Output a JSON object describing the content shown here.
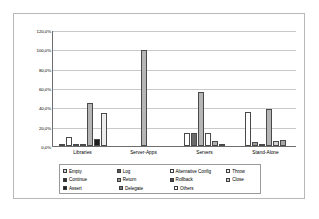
{
  "chart_data": {
    "type": "bar",
    "title": "",
    "subtitle": "",
    "xlabel": "",
    "ylabel": "",
    "ylim": [
      0,
      120
    ],
    "grid": true,
    "legend_position": "bottom",
    "ytick_labels": [
      "120,0%",
      "100,0%",
      "80,0%",
      "60,0%",
      "40,0%",
      "20,0%",
      "0,0%"
    ],
    "ytick_values": [
      120,
      100,
      80,
      60,
      40,
      20,
      0
    ],
    "categories": [
      "Libraries",
      "Server-Apps",
      "Servers",
      "Stand-Alone"
    ],
    "series": [
      {
        "name": "Empty",
        "color": "#d9d9d9",
        "values": [
          1.5,
          0,
          0,
          0
        ]
      },
      {
        "name": "Log",
        "color": "#5a5a5a",
        "values": [
          0,
          0,
          0,
          0
        ]
      },
      {
        "name": "Alternative Config",
        "color": "#ffffff",
        "values": [
          9.0,
          0,
          13.0,
          35.0
        ]
      },
      {
        "name": "Throw",
        "color": "#f2f2f2",
        "values": [
          0,
          0,
          0,
          0
        ]
      },
      {
        "name": "Continue",
        "color": "#4a4a4a",
        "values": [
          1.0,
          0,
          0,
          4.5
        ]
      },
      {
        "name": "Return",
        "color": "#9a9a9a",
        "values": [
          2.5,
          0,
          13.0,
          1.0
        ]
      },
      {
        "name": "Rollback",
        "color": "#b5b5b5",
        "values": [
          44.0,
          99.5,
          56.0,
          38.0
        ]
      },
      {
        "name": "Close",
        "color": "#1e1e1e",
        "values": [
          7.0,
          0,
          0,
          0
        ]
      },
      {
        "name": "Assert",
        "color": "#2e2e2e",
        "values": [
          0,
          0,
          0,
          0
        ]
      },
      {
        "name": "Delegate",
        "color": "#8c8c8c",
        "values": [
          0,
          0,
          5.0,
          5.0
        ]
      },
      {
        "name": "Others",
        "color": "#ededed",
        "values": [
          34.0,
          0,
          2.0,
          6.0
        ]
      }
    ],
    "bars": {
      "Libraries": [
        {
          "series": "Empty",
          "value": 1.5,
          "color": "#d9d9d9"
        },
        {
          "series": "Alternative Config",
          "value": 9.0,
          "color": "#ffffff"
        },
        {
          "series": "Continue",
          "value": 1.0,
          "color": "#4a4a4a"
        },
        {
          "series": "Return",
          "value": 2.5,
          "color": "#9a9a9a"
        },
        {
          "series": "Rollback",
          "value": 44.0,
          "color": "#b5b5b5"
        },
        {
          "series": "Close",
          "value": 7.0,
          "color": "#1e1e1e"
        },
        {
          "series": "Others",
          "value": 34.0,
          "color": "#ededed"
        }
      ],
      "Server-Apps": [
        {
          "series": "Rollback",
          "value": 99.5,
          "color": "#b5b5b5"
        }
      ],
      "Servers": [
        {
          "series": "Alternative Config",
          "value": 13.0,
          "color": "#ffffff"
        },
        {
          "series": "Return",
          "value": 13.0,
          "color": "#6b6b6b"
        },
        {
          "series": "Rollback",
          "value": 56.0,
          "color": "#b5b5b5"
        },
        {
          "series": "Throw",
          "value": 13.0,
          "color": "#ffffff"
        },
        {
          "series": "Delegate",
          "value": 5.0,
          "color": "#b0b0b0"
        },
        {
          "series": "Others",
          "value": 2.0,
          "color": "#8c8c8c"
        }
      ],
      "Stand-Alone": [
        {
          "series": "Alternative Config",
          "value": 35.0,
          "color": "#ffffff"
        },
        {
          "series": "Continue",
          "value": 4.5,
          "color": "#9e9e9e"
        },
        {
          "series": "Return",
          "value": 1.0,
          "color": "#4a4a4a"
        },
        {
          "series": "Rollback",
          "value": 38.0,
          "color": "#b5b5b5"
        },
        {
          "series": "Delegate",
          "value": 5.0,
          "color": "#d2d2d2"
        },
        {
          "series": "Others",
          "value": 6.0,
          "color": "#a8a8a8"
        }
      ]
    }
  },
  "legend": {
    "rows": [
      [
        {
          "label": "Empty",
          "color": "#d9d9d9"
        },
        {
          "label": "Log",
          "color": "#5a5a5a"
        },
        {
          "label": "Alternative Config",
          "color": "#ffffff"
        },
        {
          "label": "Throw",
          "color": "#f2f2f2"
        }
      ],
      [
        {
          "label": "Continue",
          "color": "#2e2e2e"
        },
        {
          "label": "Return",
          "color": "#9a9a9a"
        },
        {
          "label": "Rollback",
          "color": "#4a4a4a"
        },
        {
          "label": "Close",
          "color": "#d0d0d0"
        }
      ],
      [
        {
          "label": "Assert",
          "color": "#1e1e1e"
        },
        {
          "label": "Delegate",
          "color": "#7d7d7d"
        },
        {
          "label": "Others",
          "color": "#fbfbfb"
        }
      ]
    ]
  },
  "style": {
    "frame_border": "#b8b8b8",
    "axis_color": "#6e6e6e",
    "grid_color": "#c9c9c9",
    "plot_background": "#ffffff"
  }
}
